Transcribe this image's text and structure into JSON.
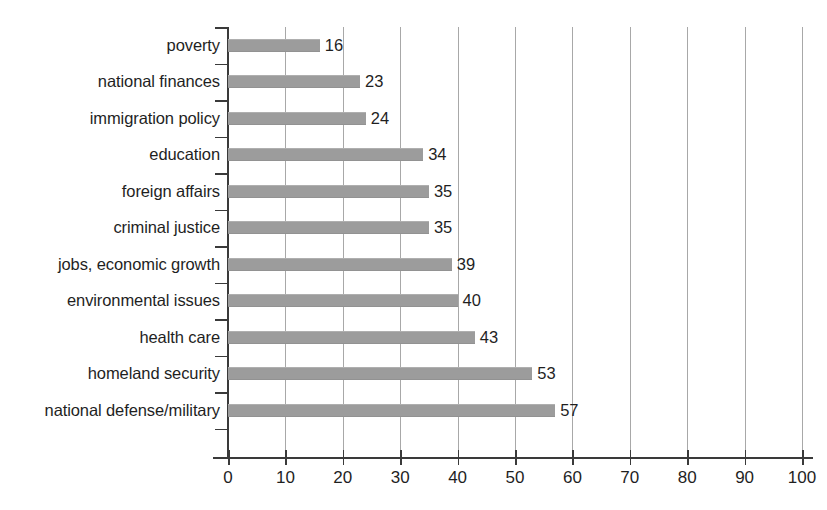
{
  "chart_data": {
    "type": "bar",
    "orientation": "horizontal",
    "title": "",
    "subtitle": "",
    "xlabel": "",
    "ylabel": "",
    "xlim": [
      0,
      100
    ],
    "xticks": [
      0,
      10,
      20,
      30,
      40,
      50,
      60,
      70,
      80,
      90,
      100
    ],
    "grid": "vertical",
    "legend": "none",
    "bar_color": "#9c9c9c",
    "axis_color": "#3a3a3a",
    "gridline_color": "#a8a8a8",
    "categories": [
      "poverty",
      "national finances",
      "immigration policy",
      "education",
      "foreign affairs",
      "criminal justice",
      "jobs, economic growth",
      "environmental issues",
      "health care",
      "homeland security",
      "national defense/military"
    ],
    "values": [
      16,
      23,
      24,
      34,
      35,
      35,
      39,
      40,
      43,
      53,
      57
    ],
    "value_labels": [
      "16",
      "23",
      "24",
      "34",
      "35",
      "35",
      "39",
      "40",
      "43",
      "53",
      "57"
    ],
    "tick_labels": [
      "0",
      "10",
      "20",
      "30",
      "40",
      "50",
      "60",
      "70",
      "80",
      "90",
      "100"
    ]
  }
}
